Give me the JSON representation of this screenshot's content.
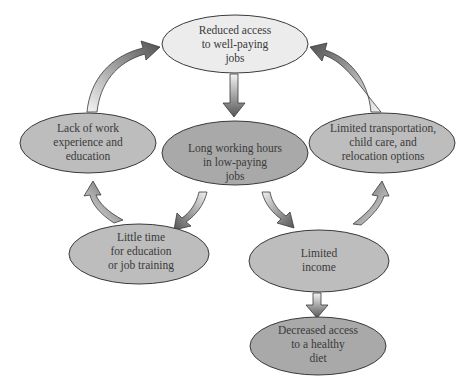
{
  "diagram": {
    "type": "cycle-flowchart",
    "colors": {
      "light_node_fill": "#ececec",
      "mid_node_fill": "#bdbdbd",
      "dark_node_fill": "#a9a9a9",
      "node_stroke": "#3a3a3a",
      "arrow_dark": "#555555",
      "arrow_light": "#f4f4f4",
      "text": "#3a3a3a"
    },
    "nodes": [
      {
        "id": "reduced-access",
        "lines": [
          "Reduced access",
          "to well-paying",
          "jobs"
        ]
      },
      {
        "id": "lack-of-work",
        "lines": [
          "Lack of work",
          "experience and",
          "education"
        ]
      },
      {
        "id": "long-hours",
        "lines": [
          "Long working hours",
          "in low-paying",
          "jobs"
        ]
      },
      {
        "id": "limited-transport",
        "lines": [
          "Limited transportation,",
          "child care, and",
          "relocation options"
        ]
      },
      {
        "id": "little-time",
        "lines": [
          "Little time",
          "for education",
          "or job training"
        ]
      },
      {
        "id": "limited-income",
        "lines": [
          "Limited",
          "income"
        ]
      },
      {
        "id": "decreased-diet",
        "lines": [
          "Decreased access",
          "to a healthy",
          "diet"
        ]
      }
    ],
    "edges": [
      {
        "from": "reduced-access",
        "to": "long-hours"
      },
      {
        "from": "long-hours",
        "to": "little-time"
      },
      {
        "from": "long-hours",
        "to": "limited-income"
      },
      {
        "from": "little-time",
        "to": "lack-of-work"
      },
      {
        "from": "lack-of-work",
        "to": "reduced-access"
      },
      {
        "from": "limited-income",
        "to": "limited-transport"
      },
      {
        "from": "limited-transport",
        "to": "reduced-access"
      },
      {
        "from": "limited-income",
        "to": "decreased-diet"
      }
    ]
  }
}
